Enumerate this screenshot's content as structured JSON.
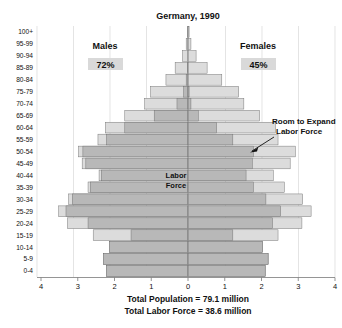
{
  "chart_data": {
    "type": "bar",
    "subtype": "population-pyramid",
    "title": "Germany, 1990",
    "left_group_label": "Males",
    "right_group_label": "Females",
    "left_group_pct": "72%",
    "right_group_pct": "45%",
    "center_label_line1": "Labor",
    "center_label_line2": "Force",
    "annotation_line1": "Room to Expand",
    "annotation_line2": "Labor Force",
    "xlabel": "",
    "ylabel": "",
    "xlim": [
      -4,
      4
    ],
    "xticks": [
      "4",
      "3",
      "2",
      "1",
      "0",
      "1",
      "2",
      "3",
      "4"
    ],
    "xtick_values": [
      -4,
      -3,
      -2,
      -1,
      0,
      1,
      2,
      3,
      4
    ],
    "grid": true,
    "units": "millions",
    "categories": [
      "0-4",
      "5-9",
      "10-14",
      "15-19",
      "20-24",
      "25-29",
      "30-34",
      "35-39",
      "40-44",
      "45-49",
      "50-54",
      "55-59",
      "60-64",
      "65-69",
      "70-74",
      "75-79",
      "80-84",
      "85-89",
      "90-94",
      "95-99",
      "100+"
    ],
    "series": [
      {
        "name": "Males total",
        "side": "left",
        "color": "#dcdcdc",
        "values": [
          2.22,
          2.3,
          2.13,
          2.58,
          3.28,
          3.52,
          3.25,
          2.72,
          2.42,
          2.88,
          2.98,
          2.45,
          2.25,
          1.72,
          1.18,
          1.02,
          0.6,
          0.35,
          0.15,
          0.05,
          0.02
        ]
      },
      {
        "name": "Males labor force",
        "side": "left",
        "color": "#b8b8b8",
        "values": [
          2.22,
          2.3,
          2.13,
          1.55,
          2.72,
          3.32,
          3.15,
          2.66,
          2.36,
          2.78,
          2.86,
          2.22,
          1.72,
          0.92,
          0.3,
          0.12,
          0.05,
          0.02,
          0.0,
          0.0,
          0.0
        ]
      },
      {
        "name": "Females total",
        "side": "right",
        "color": "#dcdcdc",
        "values": [
          2.1,
          2.18,
          2.02,
          2.45,
          3.1,
          3.35,
          3.12,
          2.62,
          2.32,
          2.78,
          2.92,
          2.45,
          2.38,
          1.95,
          1.52,
          1.38,
          0.92,
          0.52,
          0.22,
          0.08,
          0.03
        ]
      },
      {
        "name": "Females labor force",
        "side": "right",
        "color": "#b8b8b8",
        "values": [
          2.1,
          2.18,
          2.02,
          1.22,
          2.3,
          2.52,
          2.12,
          1.78,
          1.58,
          1.75,
          1.78,
          1.22,
          0.78,
          0.28,
          0.08,
          0.03,
          0.0,
          0.0,
          0.0,
          0.0,
          0.0
        ]
      }
    ],
    "footnote_line1": "Total Population = 79.1 million",
    "footnote_line2": "Total Labor Force = 38.6 million"
  },
  "colors": {
    "labor_force_fill": "#b8b8b8",
    "non_labor_fill": "#dcdcdc",
    "bar_outline": "#6e6e6e",
    "gridline": "#d8d8d8",
    "axis": "#7a7a7a"
  }
}
